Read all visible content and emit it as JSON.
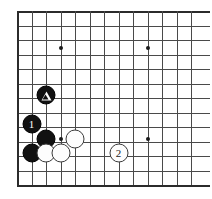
{
  "figure": {
    "board_background_color": "#ffffff",
    "line_color": "#4a4a4a",
    "edge_color": "#2b2b2b",
    "black_stone_color": "#111111",
    "white_stone_color": "#fdfdfd"
  },
  "grid": {
    "origin_x": 17,
    "origin_y": 11,
    "spacing": 14.5,
    "columns": 13,
    "rows": 13,
    "vertical_x": [
      17,
      31.5,
      46,
      60.5,
      75,
      89.5,
      104,
      118.5,
      133,
      147.5,
      162,
      176.5,
      191
    ],
    "horizontal_y": [
      11,
      25.5,
      40,
      54.5,
      69,
      83.5,
      98,
      112.5,
      127,
      141.5,
      156,
      170.5,
      185
    ],
    "left_edge_x": 17,
    "top_edge_y": 11,
    "bottom_edge_y": 185
  },
  "star_points": [
    {
      "name": "star-point-upper-left",
      "x": 60.5,
      "y": 48
    },
    {
      "name": "star-point-upper-right",
      "x": 147.5,
      "y": 48
    },
    {
      "name": "star-point-lower-left",
      "x": 60.5,
      "y": 139
    },
    {
      "name": "star-point-lower-right",
      "x": 147.5,
      "y": 139
    }
  ],
  "stones": [
    {
      "id": "stone-black-triangle",
      "color": "black",
      "x": 46,
      "y": 95,
      "label": "",
      "mark": "triangle"
    },
    {
      "id": "stone-black-1",
      "color": "black",
      "x": 31.5,
      "y": 124,
      "label": "1",
      "mark": "number"
    },
    {
      "id": "stone-black-a",
      "color": "black",
      "x": 46,
      "y": 139,
      "label": "",
      "mark": "none"
    },
    {
      "id": "stone-black-b",
      "color": "black",
      "x": 31.5,
      "y": 153,
      "label": "",
      "mark": "none"
    },
    {
      "id": "stone-white-a",
      "color": "white",
      "x": 75,
      "y": 139,
      "label": "",
      "mark": "none"
    },
    {
      "id": "stone-white-b",
      "color": "white",
      "x": 46,
      "y": 153,
      "label": "",
      "mark": "none"
    },
    {
      "id": "stone-white-c",
      "color": "white",
      "x": 60.5,
      "y": 153,
      "label": "",
      "mark": "none"
    },
    {
      "id": "stone-white-2",
      "color": "white",
      "x": 118.5,
      "y": 153,
      "label": "2",
      "mark": "number"
    }
  ]
}
